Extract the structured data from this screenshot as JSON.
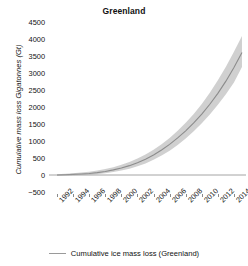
{
  "chart_data": {
    "type": "line",
    "title": "Greenland",
    "xlabel": "",
    "ylabel": "Cumulative mass loss Gigatonnes (Gt)",
    "xlim": [
      1991,
      2015.5
    ],
    "ylim": [
      -500,
      4500
    ],
    "xtick_labels": [
      "1992",
      "1994",
      "1996",
      "1998",
      "2000",
      "2002",
      "2004",
      "2006",
      "2008",
      "2010",
      "2012",
      "2014"
    ],
    "ytick_labels": [
      "4500",
      "4000",
      "3500",
      "3000",
      "2500",
      "2000",
      "1500",
      "1000",
      "500",
      "0",
      "-500"
    ],
    "ytick_values": [
      4500,
      4000,
      3500,
      3000,
      2500,
      2000,
      1500,
      1000,
      500,
      0,
      -500
    ],
    "grid": false,
    "legend_position": "bottom",
    "legend": [
      "Cumulative ice mass loss (Greenland)"
    ],
    "line_color": "#808080",
    "band_color": "#c8c8c8",
    "x": [
      1992,
      1993,
      1994,
      1995,
      1996,
      1997,
      1998,
      1999,
      2000,
      2001,
      2002,
      2003,
      2004,
      2005,
      2006,
      2007,
      2008,
      2009,
      2010,
      2011,
      2012,
      2013,
      2014,
      2015
    ],
    "series": [
      {
        "name": "Cumulative ice mass loss (Greenland)",
        "values": [
          0,
          8,
          18,
          30,
          45,
          70,
          105,
          150,
          205,
          275,
          360,
          465,
          590,
          735,
          900,
          1090,
          1300,
          1530,
          1790,
          2080,
          2400,
          2760,
          3160,
          3600
        ]
      },
      {
        "name": "Uncertainty upper bound",
        "values": [
          25,
          35,
          50,
          70,
          95,
          130,
          175,
          230,
          300,
          385,
          485,
          605,
          745,
          905,
          1090,
          1300,
          1535,
          1795,
          2090,
          2420,
          2785,
          3185,
          3625,
          4090
        ]
      },
      {
        "name": "Uncertainty lower bound",
        "values": [
          -25,
          -15,
          -8,
          0,
          8,
          25,
          50,
          85,
          130,
          185,
          255,
          340,
          445,
          570,
          715,
          885,
          1075,
          1285,
          1520,
          1780,
          2065,
          2375,
          2720,
          3180
        ]
      }
    ]
  }
}
